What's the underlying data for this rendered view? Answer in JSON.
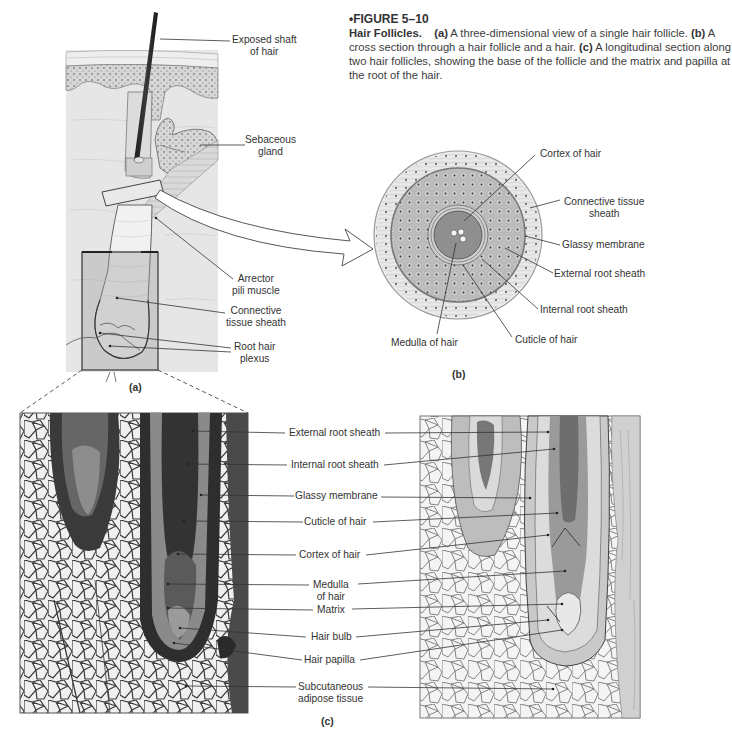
{
  "caption": {
    "figure_number": "•FIGURE 5–10",
    "title": "Hair Follicles.",
    "parts": [
      {
        "tag": "(a)",
        "text": " A three-dimensional view of a single hair follicle. "
      },
      {
        "tag": "(b)",
        "text": " A cross section through a hair follicle and a hair. "
      },
      {
        "tag": "(c)",
        "text": " A longitudinal section along two hair follicles, showing the base of the follicle and the matrix and papilla at the root of the hair."
      }
    ]
  },
  "panel_a": {
    "tag": "(a)",
    "labels": [
      {
        "line1": "Exposed shaft",
        "line2": "of hair"
      },
      {
        "line1": "Sebaceous",
        "line2": "gland"
      },
      {
        "line1": "Arrector",
        "line2": "pili muscle"
      },
      {
        "line1": "Connective",
        "line2": "tissue sheath"
      },
      {
        "line1": "Root hair",
        "line2": "plexus"
      }
    ]
  },
  "panel_b": {
    "tag": "(b)",
    "labels": [
      {
        "line1": "Cortex of hair"
      },
      {
        "line1": "Connective tissue",
        "line2": "sheath"
      },
      {
        "line1": "Glassy membrane"
      },
      {
        "line1": "External root sheath"
      },
      {
        "line1": "Internal root sheath"
      },
      {
        "line1": "Cuticle of hair"
      },
      {
        "line1": "Medulla of hair"
      }
    ]
  },
  "panel_c": {
    "tag": "(c)",
    "labels": [
      {
        "line1": "External root sheath"
      },
      {
        "line1": "Internal root sheath"
      },
      {
        "line1": "Glassy membrane"
      },
      {
        "line1": "Cuticle of hair"
      },
      {
        "line1": "Cortex of hair"
      },
      {
        "line1": "Medulla",
        "line2": "of hair"
      },
      {
        "line1": "Matrix"
      },
      {
        "line1": "Hair bulb"
      },
      {
        "line1": "Hair papilla"
      },
      {
        "line1": "Subcutaneous",
        "line2": "adipose tissue"
      }
    ]
  },
  "colors": {
    "skin_bg": "#e4e4e4",
    "dotted_layer": "#d2d2d2",
    "follicle": "#efefef",
    "cross_outer": "#e6e6e6",
    "cross_middle": "#b9b9b9",
    "cross_core": "#8f8f8f",
    "micrograph_dark": "#2a2a2a",
    "adipose_fill": "#f2f2f2"
  }
}
